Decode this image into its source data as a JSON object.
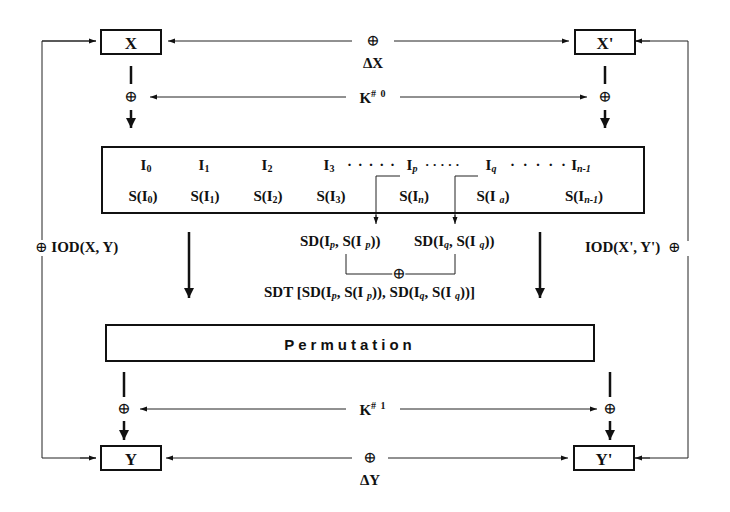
{
  "top": {
    "x_label": "X",
    "x_prime_label": "X'",
    "xor_symbol": "⊕",
    "delta_x": "ΔX",
    "key0_base": "K",
    "key0_sup": "# 0"
  },
  "state_box": {
    "row1": [
      {
        "base": "I",
        "sub": "0"
      },
      {
        "base": "I",
        "sub": "1"
      },
      {
        "base": "I",
        "sub": "2"
      },
      {
        "base": "I",
        "sub": "3"
      },
      {
        "base": "I",
        "sub": "p"
      },
      {
        "base": "I",
        "sub": "q"
      },
      {
        "base": "I",
        "sub": "n-1"
      }
    ],
    "dots": "· · · · ·",
    "row2": [
      {
        "pre": "S(I",
        "sub": "0",
        "post": ")"
      },
      {
        "pre": "S(I",
        "sub": "1",
        "post": ")"
      },
      {
        "pre": "S(I",
        "sub": "2",
        "post": ")"
      },
      {
        "pre": "S(I",
        "sub": "3",
        "post": ")"
      },
      {
        "pre": "S(I",
        "sub": "n",
        "post": ")"
      },
      {
        "pre": "S(I ",
        "sub": "a",
        "post": ")"
      },
      {
        "pre": "S(I",
        "sub": "n-1",
        "post": ")"
      }
    ]
  },
  "middle": {
    "iod_left": "IOD(X, Y)",
    "iod_right": "IOD(X', Y')",
    "sd_p": {
      "a": "SD(I",
      "sub1": "p",
      "b": ", S(I ",
      "sub2": "p",
      "c": "))"
    },
    "sd_q": {
      "a": "SD(I",
      "sub1": "q",
      "b": ", S(I ",
      "sub2": "q",
      "c": "))"
    },
    "sdt": {
      "a": "SDT [SD(I",
      "s1": "p",
      "b": ", S(I ",
      "s2": "p",
      "c": ")), SD(I",
      "s3": "q",
      "d": ", S(I ",
      "s4": "q",
      "e": "))]"
    }
  },
  "permutation": {
    "label": "Permutation"
  },
  "bottom": {
    "y_label": "Y",
    "y_prime_label": "Y'",
    "delta_y": "ΔY",
    "key1_base": "K",
    "key1_sup": "# 1"
  }
}
